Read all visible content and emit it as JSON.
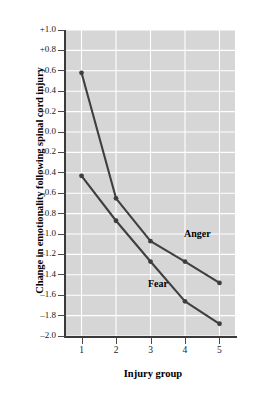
{
  "chart_data": {
    "type": "line",
    "title": "",
    "xlabel": "Injury group",
    "ylabel": "Change in emotionality following spinal cord injury",
    "x": [
      1,
      2,
      3,
      4,
      5
    ],
    "categories": [
      "1",
      "2",
      "3",
      "4",
      "5"
    ],
    "xlim": [
      0.55,
      5.45
    ],
    "ylim": [
      -2.0,
      1.0
    ],
    "xticks": [
      "1",
      "2",
      "3",
      "4",
      "5"
    ],
    "yticks": [
      "+1.0",
      "+0.8",
      "+0.6",
      "+0.4",
      "+0.2",
      "0.0",
      "–0.2",
      "–0.4",
      "–0.6",
      "–0.8",
      "–1.0",
      "–1.2",
      "–1.4",
      "–1.6",
      "–1.8",
      "–2.0"
    ],
    "ytick_values": [
      1.0,
      0.8,
      0.6,
      0.4,
      0.2,
      0.0,
      -0.2,
      -0.4,
      -0.6,
      -0.8,
      -1.0,
      -1.2,
      -1.4,
      -1.6,
      -1.8,
      -2.0
    ],
    "grid": true,
    "grid_color": "#ffffff",
    "plot_background": "#d6d6d6",
    "legend": "inline-annotations",
    "series": [
      {
        "name": "Anger",
        "color": "#3f3f3f",
        "values": [
          0.58,
          -0.65,
          -1.07,
          -1.27,
          -1.48
        ],
        "label_position": {
          "x": 184,
          "y": 228
        }
      },
      {
        "name": "Fear",
        "color": "#3f3f3f",
        "values": [
          -0.43,
          -0.87,
          -1.27,
          -1.66,
          -1.88
        ],
        "label_position": {
          "x": 148,
          "y": 278
        }
      }
    ],
    "annotations": [
      {
        "text": "Anger",
        "series": "Anger"
      },
      {
        "text": "Fear",
        "series": "Fear"
      }
    ]
  }
}
